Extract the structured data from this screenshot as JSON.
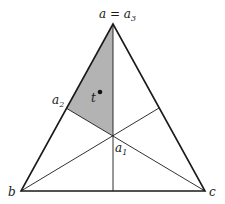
{
  "diagram": {
    "type": "triangle-barycentric-subdivision",
    "labels": {
      "apex": "a = a",
      "apex_sub": "3",
      "a2": "a",
      "a2_sub": "2",
      "a1": "a",
      "a1_sub": "1",
      "t": "t",
      "b": "b",
      "c": "c"
    },
    "colors": {
      "stroke": "#1a1a1a",
      "shade": "#b3b3b3",
      "background": "#ffffff"
    },
    "shaded_region": "triangle a3-a2-a1"
  }
}
